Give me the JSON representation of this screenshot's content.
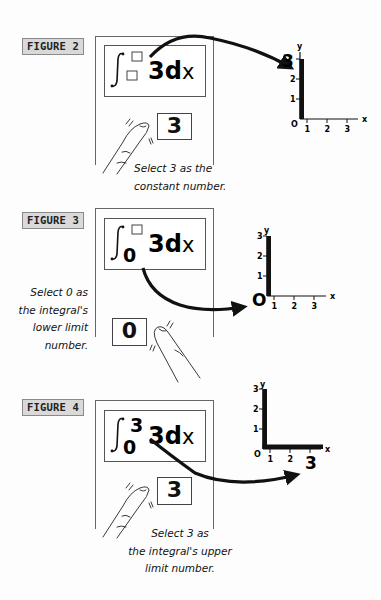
{
  "figures": [
    {
      "label": "FIGURE 2",
      "integral": {
        "upper": "",
        "lower": "",
        "integrand": "3dx",
        "upper_empty": true,
        "lower_empty": true
      },
      "selected_button": "3",
      "caption_lines": [
        "Select 3 as the",
        "constant number."
      ],
      "graph": {
        "x_axis_label": "x",
        "y_axis_label": "y",
        "x_ticks": [
          "1",
          "2",
          "3"
        ],
        "y_ticks": [
          "1",
          "2",
          "3"
        ],
        "origin_label": "O",
        "highlighted_label": "3",
        "highlighted_axis": "y",
        "area": {
          "x_from": 0,
          "x_to": 0,
          "height": 3
        }
      }
    },
    {
      "label": "FIGURE 3",
      "integral": {
        "upper": "",
        "lower": "0",
        "integrand": "3dx",
        "upper_empty": true,
        "lower_empty": false
      },
      "selected_button": "0",
      "caption_lines": [
        "Select 0 as",
        "the integral's",
        "lower limit",
        "number."
      ],
      "graph": {
        "x_axis_label": "x",
        "y_axis_label": "y",
        "x_ticks": [
          "1",
          "2",
          "3"
        ],
        "y_ticks": [
          "1",
          "2",
          "3"
        ],
        "origin_label": "O",
        "highlighted_label": "O",
        "highlighted_axis": "origin",
        "area": {
          "x_from": 0,
          "x_to": 0,
          "height": 3
        }
      }
    },
    {
      "label": "FIGURE 4",
      "integral": {
        "upper": "3",
        "lower": "0",
        "integrand": "3dx",
        "upper_empty": false,
        "lower_empty": false
      },
      "selected_button": "3",
      "caption_lines": [
        "Select 3 as",
        "the integral's upper",
        "limit number."
      ],
      "graph": {
        "x_axis_label": "x",
        "y_axis_label": "y",
        "x_ticks": [
          "1",
          "2",
          "3"
        ],
        "y_ticks": [
          "1",
          "2",
          "3"
        ],
        "origin_label": "O",
        "highlighted_label": "3",
        "highlighted_axis": "x",
        "area": {
          "x_from": 0,
          "x_to": 3,
          "height": 3
        }
      }
    }
  ]
}
